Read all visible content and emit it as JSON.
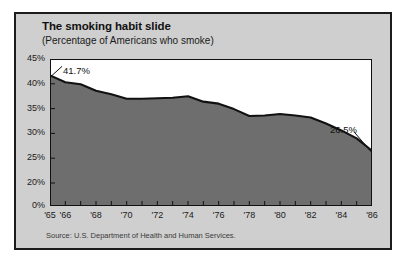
{
  "figure": {
    "title": "The smoking habit slide",
    "subtitle": "(Percentage of Americans who smoke)",
    "source": "Source: U.S. Department of Health and Human Services.",
    "panel_background": "#cfcfcf",
    "plot_background": "#ffffff",
    "area_fill": "#6e6e6e",
    "line_color": "#111111",
    "border_color": "#1c1c1c"
  },
  "chart_data": {
    "type": "area",
    "title": "The smoking habit slide",
    "subtitle": "(Percentage of Americans who smoke)",
    "xlabel": "",
    "ylabel": "",
    "grid": false,
    "legend": "none",
    "ylim": [
      0,
      45
    ],
    "y_axis_break": true,
    "y_axis_break_note": "Axis compressed between 0% and 20%",
    "ytick_labels": [
      "45%",
      "40%",
      "35%",
      "30%",
      "25%",
      "20%",
      "0%"
    ],
    "ytick_values": [
      45,
      40,
      35,
      30,
      25,
      20,
      0
    ],
    "xtick_labels": [
      "'65",
      "'66",
      "'68",
      "'70",
      "'72",
      "'74",
      "'76",
      "'78",
      "'80",
      "'82",
      "'84",
      "'86"
    ],
    "xtick_values": [
      1965,
      1966,
      1968,
      1970,
      1972,
      1974,
      1976,
      1978,
      1980,
      1982,
      1984,
      1986
    ],
    "x": [
      1965,
      1966,
      1967,
      1968,
      1969,
      1970,
      1971,
      1972,
      1973,
      1974,
      1975,
      1976,
      1977,
      1978,
      1979,
      1980,
      1981,
      1982,
      1983,
      1984,
      1985,
      1986
    ],
    "values": [
      41.7,
      40.3,
      39.9,
      38.6,
      37.9,
      37.0,
      37.0,
      37.1,
      37.2,
      37.5,
      36.4,
      36.0,
      34.9,
      33.5,
      33.6,
      33.9,
      33.6,
      33.2,
      32.0,
      30.6,
      29.0,
      26.5
    ],
    "series": [
      {
        "name": "Percentage of Americans who smoke",
        "values": [
          41.7,
          40.3,
          39.9,
          38.6,
          37.9,
          37.0,
          37.0,
          37.1,
          37.2,
          37.5,
          36.4,
          36.0,
          34.9,
          33.5,
          33.6,
          33.9,
          33.6,
          33.2,
          32.0,
          30.6,
          29.0,
          26.5
        ]
      }
    ],
    "annotations": [
      {
        "label": "41.7%",
        "x": 1965,
        "y": 41.7
      },
      {
        "label": "26.5%",
        "x": 1986,
        "y": 26.5
      }
    ]
  }
}
